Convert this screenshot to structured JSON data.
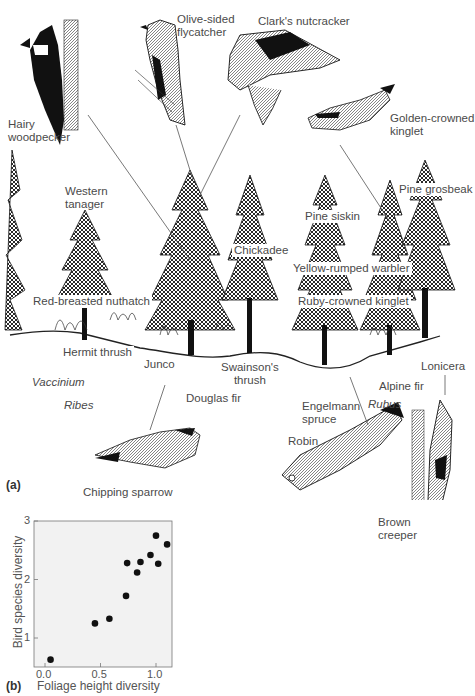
{
  "panel_a": {
    "tag": "(a)",
    "birds": {
      "hairy_woodpecker": [
        "Hairy",
        "woodpecker"
      ],
      "olive_sided_flycatcher": [
        "Olive-sided",
        "flycatcher"
      ],
      "clarks_nutcracker": "Clark's nutcracker",
      "golden_crowned_kinglet": [
        "Golden-crowned",
        "kinglet"
      ],
      "western_tanager": [
        "Western",
        "tanager"
      ],
      "pine_grosbeak": "Pine grosbeak",
      "pine_siskin": "Pine siskin",
      "chickadee": "Chickadee",
      "yellow_rumped_warbler": "Yellow-rumped warbler",
      "ruby_crowned_kinglet": "Ruby-crowned kinglet",
      "red_breasted_nuthatch": "Red-breasted nuthatch",
      "hermit_thrush": "Hermit thrush",
      "junco": "Junco",
      "swainsons_thrush": [
        "Swainson's",
        "thrush"
      ],
      "chipping_sparrow": "Chipping sparrow",
      "robin": "Robin",
      "brown_creeper": [
        "Brown",
        "creeper"
      ]
    },
    "plants": {
      "vaccinium": "Vaccinium",
      "ribes": "Ribes",
      "douglas_fir": "Douglas fir",
      "engelmann_spruce": [
        "Engelmann",
        "spruce"
      ],
      "rubus": "Rubus",
      "alpine_fir": "Alpine fir",
      "lonicera": "Lonicera"
    }
  },
  "panel_b": {
    "tag": "(b)"
  },
  "chart_data": {
    "type": "scatter",
    "title": "",
    "xlabel": "Foliage height diversity",
    "ylabel": "Bird species diversity",
    "xlim": [
      -0.1,
      1.15
    ],
    "ylim": [
      0.5,
      3.0
    ],
    "xticks": [
      0.0,
      0.5,
      1.0
    ],
    "xtick_labels": [
      "0.0",
      "0.5",
      "1.0"
    ],
    "yticks": [
      1,
      2,
      3
    ],
    "ytick_labels": [
      "1",
      "2",
      "3"
    ],
    "grid": false,
    "legend": null,
    "background": "#f2f2f2",
    "point_color": "#111111",
    "points": [
      {
        "x": 0.05,
        "y": 0.63
      },
      {
        "x": 0.45,
        "y": 1.25
      },
      {
        "x": 0.58,
        "y": 1.33
      },
      {
        "x": 0.73,
        "y": 1.72
      },
      {
        "x": 0.74,
        "y": 2.28
      },
      {
        "x": 0.83,
        "y": 2.12
      },
      {
        "x": 0.86,
        "y": 2.3
      },
      {
        "x": 0.95,
        "y": 2.42
      },
      {
        "x": 1.0,
        "y": 2.75
      },
      {
        "x": 1.02,
        "y": 2.27
      },
      {
        "x": 1.1,
        "y": 2.6
      }
    ]
  }
}
